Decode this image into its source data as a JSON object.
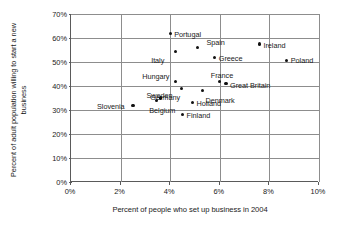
{
  "chart_data": {
    "type": "scatter",
    "title": "",
    "xlabel": "Percent of people who set up business in 2004",
    "ylabel": "Percent of adult population willing to start a new business",
    "xlim": [
      0,
      10
    ],
    "ylim": [
      0,
      70
    ],
    "xticks": [
      "0%",
      "2%",
      "4%",
      "6%",
      "8%",
      "10%"
    ],
    "xtick_values": [
      0,
      2,
      4,
      6,
      8,
      10
    ],
    "yticks": [
      "0%",
      "10%",
      "20%",
      "30%",
      "40%",
      "50%",
      "60%",
      "70%"
    ],
    "ytick_values": [
      0,
      10,
      20,
      30,
      40,
      50,
      60,
      70
    ],
    "grid": true,
    "legend": "none",
    "marker_color": "#111111",
    "points": [
      {
        "label": "Portugal",
        "x": 4.0,
        "y": 62.0,
        "label_dx": 4,
        "label_dy": -3.5
      },
      {
        "label": "Spain",
        "x": 5.1,
        "y": 56.0,
        "label_dx": 9,
        "label_dy": -9.5
      },
      {
        "label": "Ireland",
        "x": 7.6,
        "y": 57.5,
        "label_dx": 4,
        "label_dy": -3.5
      },
      {
        "label": "Italy",
        "x": 4.2,
        "y": 54.5,
        "label_dx": -24,
        "label_dy": 4.5
      },
      {
        "label": "Greece",
        "x": 5.8,
        "y": 52.0,
        "label_dx": 4,
        "label_dy": -3.5
      },
      {
        "label": "Poland",
        "x": 8.7,
        "y": 50.5,
        "label_dx": 4,
        "label_dy": -4.5
      },
      {
        "label": "Hungary",
        "x": 4.2,
        "y": 42.0,
        "label_dx": -33,
        "label_dy": -9.5
      },
      {
        "label": "France",
        "x": 6.0,
        "y": 42.0,
        "label_dx": -9,
        "label_dy": -10.5
      },
      {
        "label": "Great Britain",
        "x": 6.25,
        "y": 41.0,
        "label_dx": 4,
        "label_dy": -3.0
      },
      {
        "label": "Germany",
        "x": 4.45,
        "y": 39.0,
        "label_dx": -31,
        "label_dy": 5.0
      },
      {
        "label": "Denmark",
        "x": 5.3,
        "y": 38.0,
        "label_dx": 3,
        "label_dy": 5.0
      },
      {
        "label": "Sweden",
        "x": 3.45,
        "y": 34.0,
        "label_dx": -10,
        "label_dy": -9.5
      },
      {
        "label": "Belgium",
        "x": 3.6,
        "y": 35.0,
        "label_dx": -11,
        "label_dy": 7.5
      },
      {
        "label": "Holland",
        "x": 4.9,
        "y": 33.0,
        "label_dx": 4,
        "label_dy": -3.5
      },
      {
        "label": "Slovenia",
        "x": 2.5,
        "y": 32.0,
        "label_dx": -36,
        "label_dy": -3.5
      },
      {
        "label": "Finland",
        "x": 4.5,
        "y": 28.0,
        "label_dx": 4,
        "label_dy": -3.5
      }
    ]
  }
}
